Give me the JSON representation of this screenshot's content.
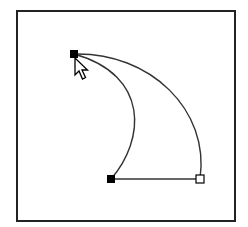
{
  "diagram": {
    "type": "bezier-path-edit-illustration",
    "colors": {
      "background": "#ffffff",
      "frame": "#222222",
      "path": "#333333",
      "anchor_selected": "#000000",
      "anchor_unselected": "#ffffff"
    },
    "frame": {
      "x": 17,
      "y": 11,
      "w": 218,
      "h": 210
    },
    "anchors": [
      {
        "id": "top-anchor",
        "x": 74,
        "y": 54,
        "state": "selected"
      },
      {
        "id": "bottom-left-anchor",
        "x": 111,
        "y": 179,
        "state": "selected"
      },
      {
        "id": "bottom-right-anchor",
        "x": 200,
        "y": 179,
        "state": "unselected"
      }
    ],
    "segments": [
      {
        "id": "inner-curve",
        "d": "M74,54 C150,75 145,140 111,179"
      },
      {
        "id": "outer-curve",
        "d": "M74,54 C150,52 210,110 200,179"
      },
      {
        "id": "bottom-line",
        "d": "M111,179 L200,179"
      }
    ],
    "cursor": {
      "icon": "arrow-pointer-icon",
      "x": 75,
      "y": 58
    }
  }
}
